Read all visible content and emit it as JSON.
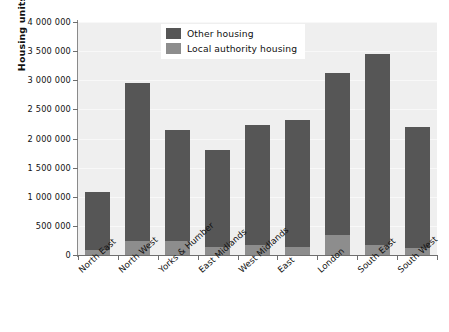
{
  "chart_data": {
    "type": "bar",
    "title": "",
    "subtitle": "",
    "xlabel": "",
    "ylabel": "Housing units",
    "stacked": true,
    "grid": true,
    "legend_position": "top-center",
    "ylim": [
      0,
      4000000
    ],
    "ytick_values": [
      0,
      500000,
      1000000,
      1500000,
      2000000,
      2500000,
      3000000,
      3500000,
      4000000
    ],
    "ytick_labels": [
      "0",
      "500 000",
      "1 000 000",
      "1 500 000",
      "2 000 000",
      "2 500 000",
      "3 000 000",
      "3 500 000",
      "4 000 000"
    ],
    "categories": [
      "North East",
      "North West",
      "Yorks & Humber",
      "East Midlands",
      "West Midlands",
      "East",
      "London",
      "South East",
      "South West"
    ],
    "series": [
      {
        "name": "Local authority housing",
        "color": "#8d8d8d",
        "values": [
          90000,
          240000,
          245000,
          140000,
          175000,
          135000,
          340000,
          175000,
          120000
        ]
      },
      {
        "name": "Other housing",
        "color": "#565656",
        "values": [
          990000,
          2720000,
          1905000,
          1670000,
          2065000,
          2175000,
          2785000,
          3275000,
          2080000
        ]
      }
    ],
    "totals": [
      1080000,
      2960000,
      2150000,
      1810000,
      2240000,
      2310000,
      3125000,
      3450000,
      2200000
    ],
    "annotations": []
  },
  "legend": {
    "items": [
      {
        "label": "Other housing",
        "color": "#565656"
      },
      {
        "label": "Local authority housing",
        "color": "#8d8d8d"
      }
    ]
  },
  "colors": {
    "other_housing": "#565656",
    "local_authority_housing": "#8d8d8d",
    "plot_background": "#efefef",
    "axis": "#6e6e6e",
    "text": "#111111"
  }
}
